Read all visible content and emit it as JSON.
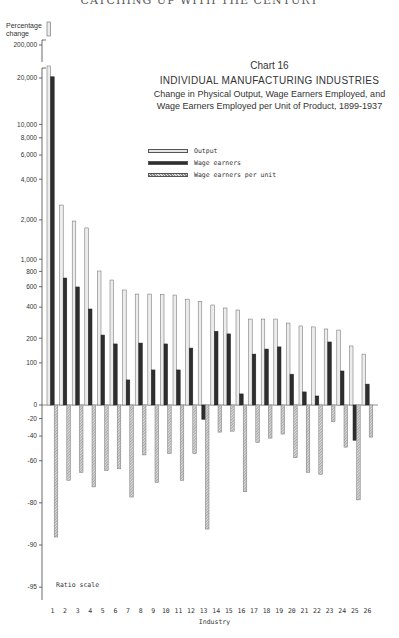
{
  "page": {
    "running_head": "CATCHING UP WITH THE CENTURY"
  },
  "chart_data": {
    "type": "bar",
    "title": "Chart 16",
    "main_title": "INDIVIDUAL MANUFACTURING INDUSTRIES",
    "subtitle_line1": "Change in Physical Output, Wage Earners Employed, and",
    "subtitle_line2": "Wage Earners Employed per Unit of Product, 1899-1937",
    "ylabel_line1": "Percentage",
    "ylabel_line2": "change",
    "xlabel": "Industry",
    "scale_note": "Ratio scale",
    "scale": "ratio (log of 1 + pct/100)",
    "yticks": [
      {
        "label": "200,000",
        "value": 200000
      },
      {
        "label": "20,000",
        "value": 20000
      },
      {
        "label": "10,000",
        "value": 10000
      },
      {
        "label": "8,000",
        "value": 8000
      },
      {
        "label": "6,000",
        "value": 6000
      },
      {
        "label": "4,000",
        "value": 4000
      },
      {
        "label": "2,000",
        "value": 2000
      },
      {
        "label": "1,000",
        "value": 1000
      },
      {
        "label": "800",
        "value": 800
      },
      {
        "label": "600",
        "value": 600
      },
      {
        "label": "400",
        "value": 400
      },
      {
        "label": "200",
        "value": 200
      },
      {
        "label": "100",
        "value": 100
      },
      {
        "label": "0",
        "value": 0
      },
      {
        "label": "-20",
        "value": -20
      },
      {
        "label": "-40",
        "value": -40
      },
      {
        "label": "-60",
        "value": -60
      },
      {
        "label": "-80",
        "value": -80
      },
      {
        "label": "-90",
        "value": -90
      },
      {
        "label": "-95",
        "value": -95
      }
    ],
    "axis_break": "between 20,000 and 200,000 (industry 1 output bar broken)",
    "categories": [
      "1",
      "2",
      "3",
      "4",
      "5",
      "6",
      "7",
      "8",
      "9",
      "10",
      "11",
      "12",
      "13",
      "14",
      "15",
      "16",
      "17",
      "18",
      "19",
      "20",
      "21",
      "22",
      "23",
      "24",
      "25",
      "26"
    ],
    "series": [
      {
        "name": "Output",
        "color": "#d9d9d9",
        "pattern": "light",
        "values": [
          200000,
          2580,
          1960,
          1740,
          806,
          681,
          563,
          520,
          520,
          515,
          510,
          470,
          450,
          418,
          393,
          377,
          311,
          311,
          311,
          285,
          267,
          261,
          249,
          243,
          164,
          131
        ]
      },
      {
        "name": "Wage earners",
        "color": "#2e2e2e",
        "pattern": "dark",
        "values": [
          22000,
          707,
          597,
          385,
          216,
          173,
          51,
          177,
          78,
          173,
          78,
          155,
          -21,
          236,
          222,
          20,
          131,
          151,
          160,
          66,
          24,
          16,
          182,
          75,
          -44,
          41
        ]
      },
      {
        "name": "Wage earners per unit",
        "color": "#a8a8a8",
        "pattern": "hatched",
        "values": [
          -88.6,
          -71,
          -67,
          -74,
          -66,
          -65,
          -78,
          -56,
          -72,
          -55,
          -71,
          -55,
          -87,
          -36,
          -35,
          -76,
          -46,
          -42,
          -38,
          -58,
          -67,
          -68,
          -24,
          -50,
          -79,
          -41
        ]
      }
    ],
    "legend_position": "upper center",
    "grid": false
  }
}
